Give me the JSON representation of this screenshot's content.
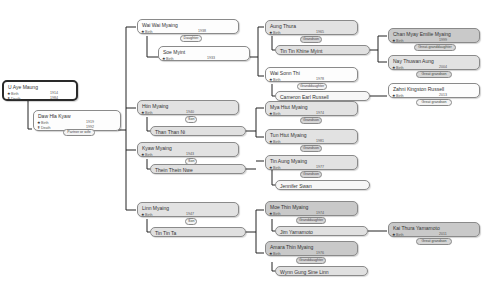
{
  "labels": {
    "born": "Birth",
    "death": "Death"
  },
  "icons": {
    "birth": "star-icon",
    "death": "cross-icon"
  },
  "colors": {
    "line": "#222222",
    "box_border": "#8a8a8a",
    "box_light": "#fdfdfd",
    "box_gray": "#e2e2e2",
    "box_dark": "#c9c9c9"
  },
  "root": {
    "person": {
      "name": "U Aye Maung",
      "birth": "1914",
      "death": "1984"
    },
    "spouse": {
      "name": "Daw Hla Kyaw",
      "birth": "1919",
      "death": "1992",
      "relation": "Partner or wife"
    }
  },
  "children": [
    {
      "name": "Wai Wai Myaing",
      "birth": "1938",
      "relation": "Daughter",
      "spouse": "Soe Myint",
      "spouse_birth": "1933"
    },
    {
      "name": "Htin Myaing",
      "birth": "1940",
      "relation": "Son",
      "spouse": "Than Than Ni"
    },
    {
      "name": "Kyaw Myaing",
      "birth": "1943",
      "relation": "Son",
      "spouse": "Thein Thein Nwe"
    },
    {
      "name": "Linn Myaing",
      "birth": "1947",
      "relation": "Son",
      "spouse": "Tin Tin Ta"
    }
  ],
  "grandchildren": [
    {
      "name": "Aung Thura",
      "birth": "1965",
      "relation": "Grandson",
      "spouse": "Tin Tin Khine Myint"
    },
    {
      "name": "Wai Sonn Thi",
      "birth": "1978",
      "relation": "Granddaughter",
      "spouse": "Cameron Earl Russell"
    },
    {
      "name": "Mya Htut Myaing",
      "birth": "1974",
      "relation": "Grandson"
    },
    {
      "name": "Tun Htut Myaing",
      "birth": "1981",
      "relation": "Grandson"
    },
    {
      "name": "Tin Aung Myaing",
      "birth": "1977",
      "relation": "Grandson",
      "spouse": "Jennifer Swan"
    },
    {
      "name": "Moe Thin Myaing",
      "birth": "1974",
      "relation": "Granddaughter",
      "spouse": "Jim Yamamoto"
    },
    {
      "name": "Amara Thin Myaing",
      "birth": "1976",
      "relation": "Granddaughter",
      "spouse": "Wynn Gung Sine Linn"
    }
  ],
  "great_grandchildren": [
    {
      "name": "Chan Myay Emilie Myaing",
      "birth": "1999",
      "relation": "Great-granddaughter"
    },
    {
      "name": "Nay Thuwan Aung",
      "birth": "2004",
      "relation": "Great grandson"
    },
    {
      "name": "Zahni Kingston Russell",
      "birth": "2013",
      "relation": "Great grandson"
    },
    {
      "name": "Kai Thura Yamamoto",
      "birth": "2011",
      "relation": "Great grandson"
    }
  ]
}
